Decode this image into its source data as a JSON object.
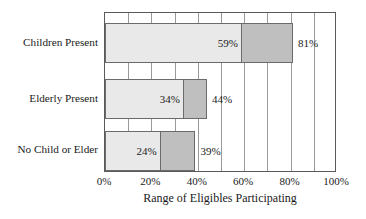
{
  "chart_data": {
    "type": "bar",
    "orientation": "horizontal",
    "title": "",
    "subtitle": "",
    "xlabel": "Range of Eligibles Participating",
    "ylabel": "",
    "categories": [
      "Children Present",
      "Elderly Present",
      "No Child or Elder"
    ],
    "series": [
      {
        "name": "lower bound",
        "values": [
          59,
          34,
          24
        ],
        "labels": [
          "59%",
          "34%",
          "24%"
        ],
        "color": "#e9e9e9"
      },
      {
        "name": "upper bound",
        "values": [
          81,
          44,
          39
        ],
        "labels": [
          "81%",
          "44%",
          "39%"
        ],
        "color": "#bfbfbf"
      }
    ],
    "xlim": [
      0,
      100
    ],
    "xticks": [
      0,
      20,
      40,
      60,
      80,
      100
    ],
    "xticklabels": [
      "0%",
      "20%",
      "40%",
      "60%",
      "80%",
      "100%"
    ],
    "gridline_interval": 10,
    "grid": true,
    "legend": "none",
    "bar_order_top_to_bottom": [
      "Children Present",
      "Elderly Present",
      "No Child or Elder"
    ]
  },
  "axis": {
    "x_tick_labels": [
      "0%",
      "20%",
      "40%",
      "60%",
      "80%",
      "100%"
    ],
    "x_axis_title": "Range of Eligibles Participating"
  },
  "bars": [
    {
      "category": "Children Present",
      "low_label": "59%",
      "high_label": "81%",
      "low_value": 59,
      "high_value": 81
    },
    {
      "category": "Elderly Present",
      "low_label": "34%",
      "high_label": "44%",
      "low_value": 34,
      "high_value": 44
    },
    {
      "category": "No Child or Elder",
      "low_label": "24%",
      "high_label": "39%",
      "low_value": 24,
      "high_value": 39
    }
  ],
  "colors": {
    "segment_low": "#e9e9e9",
    "segment_high": "#bfbfbf",
    "bar_outline": "#6b6b6b",
    "frame": "#5a5a5a",
    "gridline": "#9a9a9a",
    "text": "#1a1a1a",
    "background": "#ffffff"
  }
}
